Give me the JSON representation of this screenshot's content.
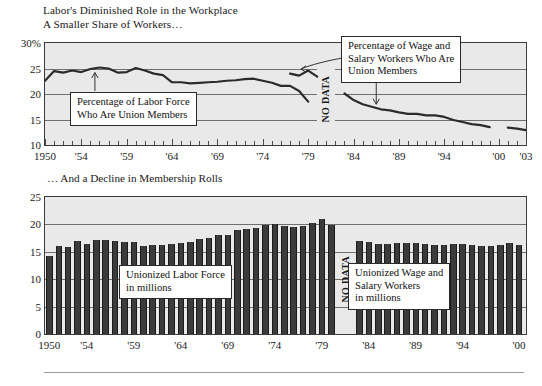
{
  "figure": {
    "title": "Labor's Diminished Role in the Workplace",
    "subtitle_top": "A Smaller Share of Workers…",
    "subtitle_bottom": "… And a Decline in Membership Rolls",
    "no_data_label": "NO DATA",
    "colors": {
      "plot_background": "#e9e9e9",
      "bar_fill": "#3b3b3b",
      "line_stroke": "#2b2b2b",
      "gridline": "#6f6f6f",
      "frame": "#3a3a3a",
      "callout_background": "#ffffff",
      "text": "#1a1a1a"
    }
  },
  "callouts": {
    "labor_force": {
      "line1": "Percentage of Labor Force",
      "line2": "Who Are Union Members"
    },
    "wage_salary": {
      "line1": "Percentage of Wage and",
      "line2": "Salary Workers Who Are",
      "line3": "Union Members"
    },
    "unionized_labor_force": {
      "line1": "Unionized Labor Force",
      "line2": "in millions"
    },
    "unionized_wage_salary": {
      "line1": "Unionized Wage and",
      "line2": "Salary Workers",
      "line3": "in millions"
    }
  },
  "chart_data": [
    {
      "type": "line",
      "id": "percent-union-members",
      "title": "A Smaller Share of Workers…",
      "xlabel": "",
      "ylabel": "",
      "ylim": [
        10,
        30
      ],
      "xlim": [
        1950,
        2003
      ],
      "yticks": [
        10,
        15,
        20,
        25,
        30
      ],
      "ytick_labels": [
        "10",
        "15",
        "20",
        "25",
        "30%"
      ],
      "xticks": [
        1950,
        1954,
        1959,
        1964,
        1969,
        1974,
        1979,
        1984,
        1989,
        1994,
        2000,
        2003
      ],
      "xtick_labels": [
        "1950",
        "'54",
        "'59",
        "'64",
        "'69",
        "'74",
        "'79",
        "'84",
        "'89",
        "'94",
        "'00",
        "'03"
      ],
      "grid": true,
      "legend_position": "annotation-callouts",
      "no_data_gap": [
        1980,
        1982
      ],
      "series": [
        {
          "name": "Percentage of Labor Force Who Are Union Members",
          "x": [
            1950,
            1951,
            1952,
            1953,
            1954,
            1955,
            1956,
            1957,
            1958,
            1959,
            1960,
            1961,
            1962,
            1963,
            1964,
            1965,
            1966,
            1967,
            1968,
            1969,
            1970,
            1971,
            1972,
            1973,
            1974,
            1975,
            1976,
            1977,
            1978,
            1979
          ],
          "values": [
            22.6,
            24.5,
            24.2,
            24.6,
            24.3,
            24.9,
            25.2,
            25.0,
            24.2,
            24.3,
            25.1,
            24.6,
            24.0,
            23.7,
            22.3,
            22.3,
            22.1,
            22.2,
            22.3,
            22.4,
            22.6,
            22.7,
            22.9,
            23.0,
            22.6,
            22.2,
            21.6,
            21.6,
            20.6,
            18.5
          ]
        },
        {
          "name": "Percentage of Wage and Salary Workers Who Are Union Members (early)",
          "x": [
            1977,
            1978,
            1979,
            1980
          ],
          "values": [
            24.0,
            23.6,
            24.6,
            23.4
          ]
        },
        {
          "name": "Percentage of Wage and Salary Workers Who Are Union Members",
          "x": [
            1983,
            1984,
            1985,
            1986,
            1987,
            1988,
            1989,
            1990,
            1991,
            1992,
            1993,
            1994,
            1995,
            1996,
            1997,
            1998,
            1999
          ],
          "values": [
            20.1,
            18.8,
            18.0,
            17.5,
            17.0,
            16.8,
            16.4,
            16.1,
            16.1,
            15.8,
            15.8,
            15.5,
            14.9,
            14.5,
            14.1,
            13.9,
            13.5
          ]
        },
        {
          "name": "Percentage of Wage and Salary Workers Who Are Union Members (late)",
          "x": [
            2001,
            2002,
            2003
          ],
          "values": [
            13.4,
            13.2,
            12.9
          ]
        }
      ]
    },
    {
      "type": "bar",
      "id": "union-membership-millions",
      "title": "… And a Decline in Membership Rolls",
      "xlabel": "",
      "ylabel": "",
      "ylim": [
        0,
        25
      ],
      "yticks": [
        0,
        5,
        10,
        15,
        20,
        25
      ],
      "ytick_labels": [
        "0",
        "5",
        "10",
        "15",
        "20",
        "25"
      ],
      "xticks": [
        1950,
        1954,
        1959,
        1964,
        1969,
        1974,
        1979,
        1984,
        1989,
        1994,
        2000
      ],
      "xtick_labels": [
        "1950",
        "'54",
        "'59",
        "'64",
        "'69",
        "'74",
        "'79",
        "'84",
        "'89",
        "'94",
        "'00"
      ],
      "grid": true,
      "no_data_gap": [
        1980,
        1982
      ],
      "series": [
        {
          "name": "Unionized Labor Force in millions",
          "categories": [
            1950,
            1951,
            1952,
            1953,
            1954,
            1955,
            1956,
            1957,
            1958,
            1959,
            1960,
            1961,
            1962,
            1963,
            1964,
            1965,
            1966,
            1967,
            1968,
            1969,
            1970,
            1971,
            1972,
            1973,
            1974,
            1975,
            1976,
            1977,
            1978,
            1979,
            1980
          ],
          "values": [
            14.3,
            16.0,
            15.9,
            16.9,
            16.5,
            17.1,
            17.1,
            16.9,
            16.8,
            16.8,
            16.1,
            16.3,
            16.3,
            16.4,
            16.6,
            16.8,
            17.3,
            17.6,
            18.1,
            18.1,
            19.0,
            19.2,
            19.4,
            19.9,
            20.0,
            19.8,
            19.6,
            19.8,
            20.2,
            20.9,
            19.9
          ]
        },
        {
          "name": "Unionized Wage and Salary Workers in millions",
          "categories": [
            1983,
            1984,
            1985,
            1986,
            1987,
            1988,
            1989,
            1990,
            1991,
            1992,
            1993,
            1994,
            1995,
            1996,
            1997,
            1998,
            1999,
            2000
          ],
          "values": [
            17.0,
            16.8,
            16.5,
            16.5,
            16.6,
            16.6,
            16.6,
            16.5,
            16.3,
            16.3,
            16.5,
            16.4,
            16.2,
            16.1,
            16.1,
            16.2,
            16.6,
            16.3
          ]
        }
      ]
    }
  ]
}
